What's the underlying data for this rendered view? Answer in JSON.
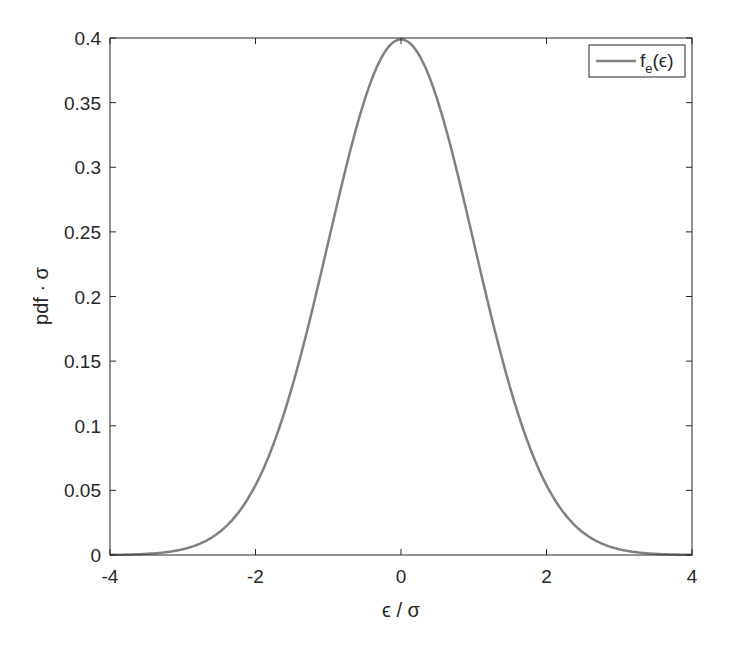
{
  "chart_data": {
    "type": "line",
    "title": "",
    "xlabel": "ϵ / σ",
    "ylabel": "pdf · σ",
    "xlim": [
      -4,
      4
    ],
    "ylim": [
      0,
      0.4
    ],
    "xticks": [
      -4,
      -2,
      0,
      2,
      4
    ],
    "xtick_labels": [
      "-4",
      "-2",
      "0",
      "2",
      "4"
    ],
    "yticks": [
      0,
      0.05,
      0.1,
      0.15,
      0.2,
      0.25,
      0.3,
      0.35,
      0.4
    ],
    "ytick_labels": [
      "0",
      "0.05",
      "0.1",
      "0.15",
      "0.2",
      "0.25",
      "0.3",
      "0.35",
      "0.4"
    ],
    "grid": false,
    "legend_position": "upper right",
    "series": [
      {
        "name": "f_e(ϵ)",
        "color": "#808080",
        "x": [
          -4,
          -3.5,
          -3,
          -2.5,
          -2,
          -1.5,
          -1,
          -0.5,
          0,
          0.5,
          1,
          1.5,
          2,
          2.5,
          3,
          3.5,
          4
        ],
        "values": [
          0.0001,
          0.0009,
          0.0044,
          0.0175,
          0.054,
          0.1295,
          0.242,
          0.352,
          0.399,
          0.352,
          0.242,
          0.1295,
          0.054,
          0.0175,
          0.0044,
          0.0009,
          0.0001
        ]
      }
    ]
  },
  "legend": {
    "label_main": "f",
    "label_sub": "e",
    "label_arg": "(ϵ)"
  },
  "axes": {
    "xlabel": "ϵ / σ",
    "ylabel": "pdf · σ"
  }
}
